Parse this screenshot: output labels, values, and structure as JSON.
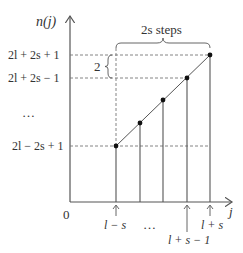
{
  "diagram": {
    "y_axis_label": "n(j)",
    "x_axis_label": "j",
    "origin_label": "0",
    "y_ticks": [
      {
        "label": "2l + 2s + 1",
        "y": 55
      },
      {
        "label": "2l + 2s − 1",
        "y": 78
      },
      {
        "label": "…",
        "y": 115
      },
      {
        "label": "2l − 2s + 1",
        "y": 146
      }
    ],
    "x_ticks": [
      {
        "label": "l − s",
        "x": 116
      },
      {
        "label": "…",
        "x": 150
      },
      {
        "label": "l + s − 1",
        "x": 187
      },
      {
        "label": "l + s",
        "x": 210
      }
    ],
    "brace_label": "2s  steps",
    "gap_label": "2",
    "points": [
      {
        "x": 116,
        "y": 146
      },
      {
        "x": 140,
        "y": 123
      },
      {
        "x": 163,
        "y": 100
      },
      {
        "x": 187,
        "y": 78
      },
      {
        "x": 210,
        "y": 55
      }
    ],
    "colors": {
      "line": "#555555",
      "point": "#111111",
      "dashed": "#777777"
    }
  }
}
